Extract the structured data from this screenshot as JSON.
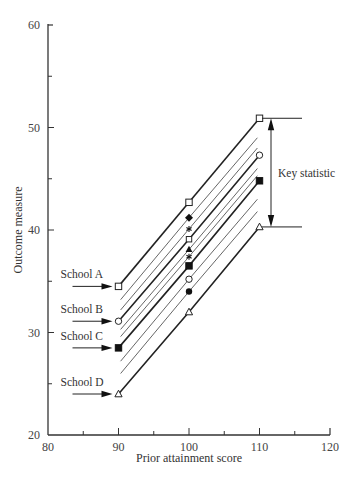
{
  "chart_data": {
    "type": "line",
    "title": "",
    "xlabel": "Prior attainment score",
    "ylabel": "Outcome measure",
    "xlim": [
      80,
      120
    ],
    "ylim": [
      20,
      60
    ],
    "x_ticks": [
      80,
      90,
      100,
      110,
      120
    ],
    "x_minor_ticks": [
      85,
      95,
      105,
      115
    ],
    "y_ticks": [
      20,
      30,
      40,
      50,
      60
    ],
    "y_minor_ticks": [
      25,
      35,
      45,
      55
    ],
    "grid": false,
    "legend": "none",
    "series": [
      {
        "name": "School A",
        "labeled": true,
        "thick": true,
        "x": [
          90,
          100,
          110
        ],
        "values": [
          34.5,
          42.7,
          50.9
        ],
        "markers": [
          "open-square",
          "open-square",
          "open-square"
        ]
      },
      {
        "name": "line-2",
        "labeled": false,
        "thick": false,
        "x": [
          90.3,
          100,
          109.7
        ],
        "values": [
          33.2,
          41.2,
          49.0
        ],
        "markers": [
          "none",
          "filled-diamond",
          "none"
        ]
      },
      {
        "name": "line-3",
        "labeled": false,
        "thick": false,
        "x": [
          90.3,
          100,
          109.7
        ],
        "values": [
          32.2,
          40.1,
          48.0
        ],
        "markers": [
          "none",
          "asterisk",
          "none"
        ]
      },
      {
        "name": "School B",
        "labeled": true,
        "thick": true,
        "x": [
          90,
          100,
          110
        ],
        "values": [
          31.1,
          39.1,
          47.3
        ],
        "markers": [
          "open-circle",
          "open-square-small",
          "open-circle"
        ]
      },
      {
        "name": "line-5",
        "labeled": false,
        "thick": false,
        "x": [
          90.3,
          100,
          109.7
        ],
        "values": [
          30.3,
          38.1,
          46.0
        ],
        "markers": [
          "none",
          "filled-triangle",
          "none"
        ]
      },
      {
        "name": "line-6",
        "labeled": false,
        "thick": false,
        "x": [
          90.3,
          100,
          109.7
        ],
        "values": [
          29.6,
          37.4,
          45.3
        ],
        "markers": [
          "none",
          "asterisk",
          "none"
        ]
      },
      {
        "name": "School C",
        "labeled": true,
        "thick": true,
        "x": [
          90,
          100,
          110
        ],
        "values": [
          28.5,
          36.5,
          44.8
        ],
        "markers": [
          "filled-square",
          "filled-square",
          "filled-square"
        ]
      },
      {
        "name": "line-8",
        "labeled": false,
        "thick": false,
        "x": [
          90.3,
          100,
          109.7
        ],
        "values": [
          27.2,
          35.2,
          43.0
        ],
        "markers": [
          "none",
          "open-circle",
          "none"
        ]
      },
      {
        "name": "line-9",
        "labeled": false,
        "thick": false,
        "x": [
          90.3,
          100,
          109.7
        ],
        "values": [
          26.0,
          34.0,
          41.8
        ],
        "markers": [
          "none",
          "filled-circle",
          "none"
        ]
      },
      {
        "name": "School D",
        "labeled": true,
        "thick": true,
        "x": [
          90,
          100,
          110
        ],
        "values": [
          24.0,
          32.0,
          40.3
        ],
        "markers": [
          "open-triangle",
          "open-triangle",
          "open-triangle"
        ]
      }
    ],
    "annotations": [
      {
        "text": "School A",
        "arrow_to": [
          90,
          34.5
        ]
      },
      {
        "text": "School B",
        "arrow_to": [
          90,
          31.1
        ]
      },
      {
        "text": "School C",
        "arrow_to": [
          90,
          28.5
        ]
      },
      {
        "text": "School D",
        "arrow_to": [
          90,
          24.0
        ]
      },
      {
        "text": "Key statistic",
        "type": "double-arrow-bracket",
        "x": 112,
        "y_range": [
          40.3,
          50.9
        ]
      }
    ]
  },
  "labels": {
    "xlabel": "Prior attainment score",
    "ylabel": "Outcome measure",
    "key_statistic": "Key statistic",
    "schools": [
      "School A",
      "School B",
      "School C",
      "School D"
    ]
  }
}
